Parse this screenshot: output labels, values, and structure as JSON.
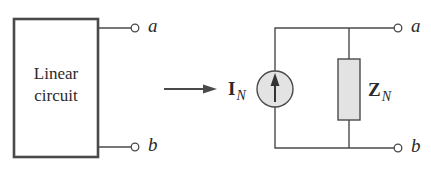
{
  "diagram": {
    "left": {
      "block_label_line1": "Linear",
      "block_label_line2": "circuit",
      "terminal_top": "a",
      "terminal_bottom": "b"
    },
    "transform_arrow": "right-arrow",
    "right": {
      "source_symbol": "I",
      "source_subscript": "N",
      "source_type": "current-source-arrow-up",
      "impedance_symbol": "Z",
      "impedance_subscript": "N",
      "terminal_top": "a",
      "terminal_bottom": "b"
    },
    "colors": {
      "line": "#4a4a4a",
      "component_fill": "#e3e3e3",
      "background": "#ffffff"
    }
  }
}
